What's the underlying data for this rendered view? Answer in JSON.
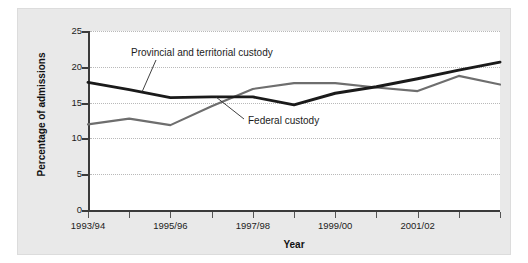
{
  "chart_data": {
    "type": "line",
    "title": "",
    "xlabel": "Year",
    "ylabel": "Percentage of admissions",
    "ylim": [
      0,
      25
    ],
    "yticks": [
      0,
      5,
      10,
      15,
      20,
      25
    ],
    "grid": true,
    "legend_position": "inline-annotations",
    "categories": [
      "1993/94",
      "1994/95",
      "1995/96",
      "1996/97",
      "1997/98",
      "1998/99",
      "1999/00",
      "2000/01",
      "2001/02",
      "2002/03",
      "2003/04"
    ],
    "tick_labels_visible": [
      "1993/94",
      "1995/96",
      "1997/98",
      "1999/00",
      "2001/02"
    ],
    "series": [
      {
        "name": "Provincial and territorial custody",
        "color": "#1a1a1a",
        "values": [
          17.9,
          16.9,
          15.8,
          15.9,
          15.9,
          14.8,
          16.4,
          17.3,
          18.4,
          19.6,
          20.7
        ]
      },
      {
        "name": "Federal custody",
        "color": "#6e6e6e",
        "values": [
          12.1,
          12.9,
          12.0,
          14.6,
          17.0,
          17.8,
          17.8,
          17.2,
          16.7,
          18.8,
          17.6
        ]
      }
    ],
    "annotations": [
      {
        "text": "Provincial and territorial custody",
        "points_to_series": "Provincial and territorial custody"
      },
      {
        "text": "Federal custody",
        "points_to_series": "Federal custody"
      }
    ]
  },
  "axes": {
    "y_title": "Percentage of admissions",
    "x_title": "Year",
    "y_labels": [
      "25",
      "20",
      "15",
      "10",
      "5",
      "0"
    ],
    "x_labels": [
      "1993/94",
      "1995/96",
      "1997/98",
      "1999/00",
      "2001/02"
    ]
  },
  "labels": {
    "provincial": "Provincial and territorial custody",
    "federal": "Federal custody"
  },
  "colors": {
    "panel_background": "#e9e9e9",
    "plot_background": "#ffffff",
    "axis": "#3b3b3b",
    "grid": "#b9b9b9",
    "series_provincial": "#1a1a1a",
    "series_federal": "#6e6e6e"
  }
}
